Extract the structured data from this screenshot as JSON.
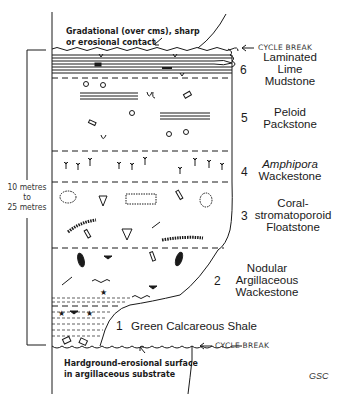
{
  "diagram": {
    "type": "stratigraphic-column",
    "top_contact_note": {
      "line1": "Gradational (over cms), sharp",
      "line2": "or erosional contact"
    },
    "bottom_contact_note": {
      "line1": "Hardground-erosional surface",
      "line2": "in argillaceous substrate"
    },
    "cycle_break_top": "CYCLE BREAK",
    "cycle_break_bottom": "CYCLE BREAK",
    "thickness": {
      "line1": "10 metres",
      "line2": "to",
      "line3": "25 metres"
    },
    "credit": "GSC",
    "units": [
      {
        "number": "6",
        "line1": "Laminated",
        "line2": "Lime",
        "line3": "Mudstone"
      },
      {
        "number": "5",
        "line1": "Peloid",
        "line2": "Packstone"
      },
      {
        "number": "4",
        "line1": "Amphipora",
        "line2": "Wackestone"
      },
      {
        "number": "3",
        "line1": "Coral-",
        "line2": "stromatoporoid",
        "line3": "Floatstone"
      },
      {
        "number": "2",
        "line1": "Nodular",
        "line2": "Argillaceous",
        "line3": "Wackestone"
      },
      {
        "number": "1",
        "line1": "Green Calcareous Shale"
      }
    ],
    "colors": {
      "ink": "#1a1a1a",
      "background": "#ffffff"
    }
  }
}
